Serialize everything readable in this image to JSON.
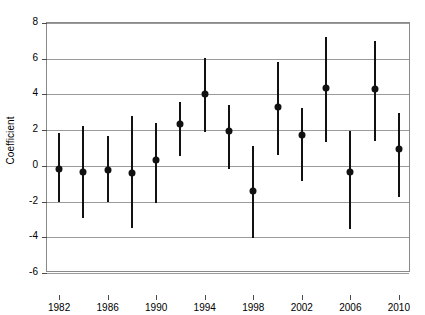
{
  "chart_data": {
    "type": "scatter",
    "title": "",
    "xlabel": "",
    "ylabel": "Coefficient",
    "xlim": [
      1981,
      2011
    ],
    "ylim": [
      -6,
      8
    ],
    "ytick_values": [
      8,
      6,
      4,
      2,
      0,
      -2,
      -4,
      -6
    ],
    "ytick_labels": [
      "8",
      "6",
      "4",
      "2",
      "0",
      "-2",
      "-4",
      "-6"
    ],
    "xtick_values": [
      1982,
      1986,
      1990,
      1994,
      1998,
      2002,
      2006,
      2010
    ],
    "xtick_labels": [
      "1982",
      "1986",
      "1990",
      "1994",
      "1998",
      "2002",
      "2006",
      "2010"
    ],
    "grid": true,
    "legend": "none",
    "error_style": "vertical-bars-95ci",
    "x": [
      1982,
      1984,
      1986,
      1988,
      1990,
      1992,
      1994,
      1996,
      1998,
      2000,
      2002,
      2004,
      2006,
      2008,
      2010
    ],
    "values": [
      -0.15,
      -0.35,
      -0.25,
      -0.4,
      0.35,
      2.35,
      4.05,
      1.95,
      -1.4,
      3.3,
      1.75,
      4.35,
      -0.35,
      4.3,
      0.95
    ],
    "ci_low": [
      -2.05,
      -2.9,
      -2.05,
      -3.5,
      -2.1,
      0.55,
      1.9,
      -0.2,
      -4.05,
      0.6,
      -0.85,
      1.35,
      -3.55,
      1.4,
      -1.75
    ],
    "ci_high": [
      1.85,
      2.25,
      1.65,
      2.8,
      2.4,
      3.55,
      6.05,
      3.4,
      1.1,
      5.8,
      3.25,
      7.2,
      1.95,
      7.0,
      2.95
    ],
    "points": [
      {
        "year": 1982,
        "coefficient": -0.15,
        "low": -2.05,
        "high": 1.85
      },
      {
        "year": 1984,
        "coefficient": -0.35,
        "low": -2.9,
        "high": 2.25
      },
      {
        "year": 1986,
        "coefficient": -0.25,
        "low": -2.05,
        "high": 1.65
      },
      {
        "year": 1988,
        "coefficient": -0.4,
        "low": -3.5,
        "high": 2.8
      },
      {
        "year": 1990,
        "coefficient": 0.35,
        "low": -2.1,
        "high": 2.4
      },
      {
        "year": 1992,
        "coefficient": 2.35,
        "low": 0.55,
        "high": 3.55
      },
      {
        "year": 1994,
        "coefficient": 4.05,
        "low": 1.9,
        "high": 6.05
      },
      {
        "year": 1996,
        "coefficient": 1.95,
        "low": -0.2,
        "high": 3.4
      },
      {
        "year": 1998,
        "coefficient": -1.4,
        "low": -4.05,
        "high": 1.1
      },
      {
        "year": 2000,
        "coefficient": 3.3,
        "low": 0.6,
        "high": 5.8
      },
      {
        "year": 2002,
        "coefficient": 1.75,
        "low": -0.85,
        "high": 3.25
      },
      {
        "year": 2004,
        "coefficient": 4.35,
        "low": 1.35,
        "high": 7.2
      },
      {
        "year": 2006,
        "coefficient": -0.35,
        "low": -3.55,
        "high": 1.95
      },
      {
        "year": 2008,
        "coefficient": 4.3,
        "low": 1.4,
        "high": 7.0
      },
      {
        "year": 2010,
        "coefficient": 0.95,
        "low": -1.75,
        "high": 2.95
      }
    ],
    "colors": {
      "marker": "#111111",
      "errorbar": "#111111",
      "grid": "#9a9a9a",
      "axis": "#8a8a8a",
      "background": "#ffffff"
    }
  }
}
